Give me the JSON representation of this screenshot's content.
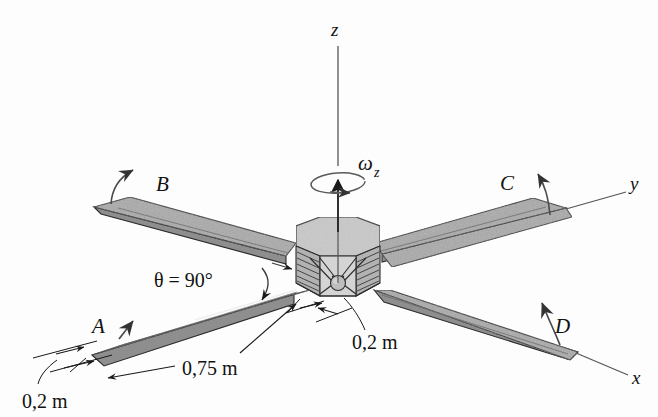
{
  "figure": {
    "background_color": "#fdfdfd",
    "line_color": "#1a1a1a",
    "panel_fill": "#a9a9a9",
    "panel_edge_fill": "#8c8c8c",
    "body_top_fill": "#c8c8c8",
    "body_side_fill": "#b5b5b5",
    "body_front_fill": "#d2d2d2"
  },
  "axes": [
    {
      "id": "z",
      "label": "z",
      "direction": "vertical-up"
    },
    {
      "id": "y",
      "label": "y",
      "direction": "upper-right"
    },
    {
      "id": "x",
      "label": "x",
      "direction": "lower-right"
    }
  ],
  "rotation": {
    "symbol": "ω",
    "subscript": "z",
    "about_axis": "z"
  },
  "panels": [
    {
      "id": "A",
      "label": "A",
      "position": "lower-left",
      "arrow": "straight-up-right"
    },
    {
      "id": "B",
      "label": "B",
      "position": "upper-left",
      "arrow": "curved-up-right"
    },
    {
      "id": "C",
      "label": "C",
      "position": "upper-right",
      "arrow": "curved-up-left"
    },
    {
      "id": "D",
      "label": "D",
      "position": "lower-right",
      "arrow": "curved-up-left"
    }
  ],
  "annotations": {
    "theta": "θ = 90°",
    "panel_length": "0,75 m",
    "panel_width": "0,2 m",
    "hub_offset": "0,2 m"
  }
}
